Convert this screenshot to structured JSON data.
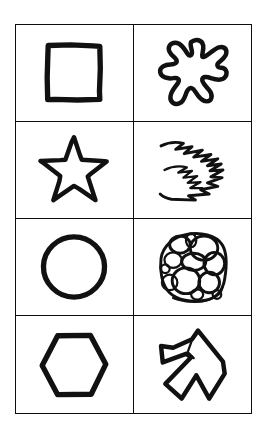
{
  "figure": {
    "background_color": "#ffffff",
    "ink_color": "#111111",
    "border_color": "#0d0d0d",
    "columns": 2,
    "rows": 4,
    "column_labels": [
      "regular-shapes",
      "irregular-shapes"
    ],
    "cells": [
      {
        "row": 1,
        "column": 1,
        "shape_name": "square",
        "shape_kind": "regular",
        "style": "hand-drawn outline",
        "stroke": "thick"
      },
      {
        "row": 1,
        "column": 2,
        "shape_name": "splat-blob",
        "shape_kind": "irregular",
        "style": "hand-drawn outline",
        "stroke": "medium"
      },
      {
        "row": 2,
        "column": 1,
        "shape_name": "five-pointed-star",
        "shape_kind": "regular",
        "style": "hand-drawn outline",
        "stroke": "medium"
      },
      {
        "row": 2,
        "column": 2,
        "shape_name": "zigzag-scribble",
        "shape_kind": "irregular",
        "style": "hand-drawn stroke",
        "stroke": "thin"
      },
      {
        "row": 3,
        "column": 1,
        "shape_name": "circle",
        "shape_kind": "regular",
        "style": "hand-drawn outline",
        "stroke": "thick"
      },
      {
        "row": 3,
        "column": 2,
        "shape_name": "bubble-cluster",
        "shape_kind": "irregular",
        "style": "hand-drawn overlapping ovals",
        "stroke": "thin"
      },
      {
        "row": 4,
        "column": 1,
        "shape_name": "hexagon",
        "shape_kind": "regular",
        "style": "hand-drawn outline",
        "stroke": "thick"
      },
      {
        "row": 4,
        "column": 2,
        "shape_name": "irregular-angular-polygon",
        "shape_kind": "irregular",
        "style": "hand-drawn outline with notch",
        "stroke": "medium"
      }
    ]
  }
}
